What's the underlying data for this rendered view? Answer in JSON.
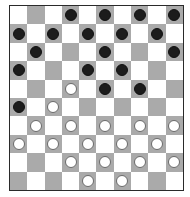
{
  "board": {
    "size": 10,
    "colors": {
      "light": "#ffffff",
      "dark": "#aaaaaa",
      "black_piece": "#1c1c1c",
      "white_piece": "#ffffff",
      "border": "#2a2a2a"
    },
    "rows": [
      [
        ".",
        "_",
        ".",
        "B",
        ".",
        "B",
        ".",
        "B",
        ".",
        "B"
      ],
      [
        "B",
        ".",
        "B",
        ".",
        "B",
        ".",
        "B",
        ".",
        "B",
        "."
      ],
      [
        ".",
        "B",
        ".",
        "_",
        ".",
        "B",
        ".",
        "_",
        ".",
        "B"
      ],
      [
        "B",
        ".",
        "_",
        ".",
        "B",
        ".",
        "B",
        ".",
        "_",
        "."
      ],
      [
        ".",
        "_",
        ".",
        "W",
        ".",
        "B",
        ".",
        "B",
        ".",
        "_"
      ],
      [
        "B",
        ".",
        "W",
        ".",
        "_",
        ".",
        "_",
        ".",
        "_",
        "."
      ],
      [
        ".",
        "W",
        ".",
        "W",
        ".",
        "W",
        ".",
        "W",
        ".",
        "W"
      ],
      [
        "W",
        ".",
        "W",
        ".",
        "W",
        ".",
        "W",
        ".",
        "W",
        "."
      ],
      [
        ".",
        "_",
        ".",
        "W",
        ".",
        "W",
        ".",
        "W",
        ".",
        "W"
      ],
      [
        "_",
        ".",
        "_",
        ".",
        "W",
        ".",
        "W",
        ".",
        "_",
        "."
      ]
    ],
    "legend": {
      ".": "light-square",
      "_": "empty-dark-square",
      "B": "black-piece",
      "W": "white-piece"
    },
    "piece_counts": {
      "black": 19,
      "white": 19
    }
  }
}
